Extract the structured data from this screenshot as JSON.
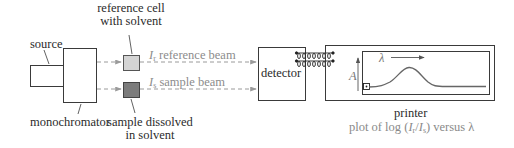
{
  "components": {
    "source": {
      "label": "source"
    },
    "monochromator": {
      "label": "monochromator"
    },
    "reference_cell": {
      "label_line1": "reference cell",
      "label_line2": "with solvent"
    },
    "sample_cell": {
      "label_line1": "sample dissolved",
      "label_line2": "in solvent"
    },
    "detector": {
      "label": "detector"
    },
    "printer": {
      "label": "printer",
      "caption_prefix": "plot of log (",
      "caption_I": "I",
      "caption_r": "r",
      "caption_slash": "/",
      "caption_s": "s",
      "caption_suffix": ") versus λ"
    }
  },
  "beams": {
    "reference": {
      "symbol": "I",
      "subscript": "r",
      "label": "reference beam"
    },
    "sample": {
      "symbol": "I",
      "subscript": "s",
      "label": "sample beam"
    }
  },
  "plot": {
    "x_axis_symbol": "λ",
    "y_axis_symbol": "A"
  },
  "colors": {
    "line": "#3a3a3a",
    "beam": "#9a9a9a",
    "reference_cell_fill": "#d4d4d4",
    "sample_cell_fill": "#7c7c7c",
    "gray_text": "#8a8a8a"
  }
}
